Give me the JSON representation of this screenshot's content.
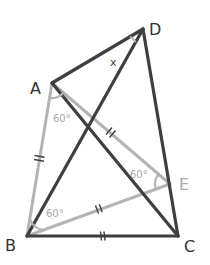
{
  "diagram": {
    "colors": {
      "dark": "#3f3f3f",
      "light": "#b4b4b4",
      "label_dark": "#333333",
      "label_light": "#a8a8a8"
    },
    "points": {
      "A": {
        "label": "A",
        "x": 52,
        "y": 83
      },
      "B": {
        "label": "B",
        "x": 27,
        "y": 236
      },
      "C": {
        "label": "C",
        "x": 178,
        "y": 236
      },
      "D": {
        "label": "D",
        "x": 143,
        "y": 29
      },
      "E": {
        "label": "E",
        "x": 170,
        "y": 184
      }
    },
    "segments_dark": [
      "AD",
      "DB",
      "DC",
      "AC",
      "BC"
    ],
    "segments_light": [
      "AB",
      "AE",
      "BE"
    ],
    "equal_marks": [
      "AB",
      "AE",
      "BE",
      "BC"
    ],
    "angles": {
      "A": "60°",
      "B": "60°",
      "E": "60°",
      "D": "x"
    }
  }
}
